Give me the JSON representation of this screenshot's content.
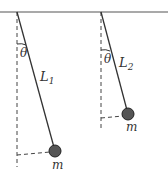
{
  "diagram": {
    "colors": {
      "line": "#333333",
      "dashed": "#444444",
      "bob": "#555555",
      "bob_stroke": "#222222",
      "ceiling": "#555555"
    },
    "pendulums": [
      {
        "id": "pendulum-1",
        "length_label": "L",
        "length_sub": "1",
        "angle_label": "θ",
        "mass_label": "m"
      },
      {
        "id": "pendulum-2",
        "length_label": "L",
        "length_sub": "2",
        "angle_label": "θ",
        "mass_label": "m"
      }
    ]
  }
}
